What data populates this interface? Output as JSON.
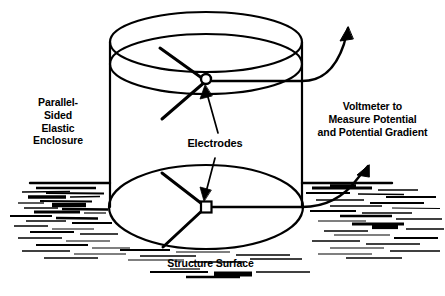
{
  "figure": {
    "kind": "technical-line-diagram",
    "background_color": "#ffffff",
    "ink_color": "#000000"
  },
  "labels": {
    "enclosure": "Parallel-\nSided\nElastic\nEnclosure",
    "voltmeter": "Voltmeter to\nMeasure Potential\nand Potential Gradient",
    "electrodes": "Electrodes",
    "structure_surface": "Structure Surface"
  },
  "parts": [
    {
      "name": "enclosure-cylinder",
      "label": "Parallel-Sided Elastic Enclosure"
    },
    {
      "name": "top-electrode",
      "label": "Electrode"
    },
    {
      "name": "bottom-electrode",
      "label": "Electrode"
    },
    {
      "name": "upper-lead-wire",
      "label": "Voltmeter lead"
    },
    {
      "name": "lower-lead-wire",
      "label": "Voltmeter lead"
    },
    {
      "name": "ground-surface",
      "label": "Structure Surface"
    }
  ],
  "geometry": {
    "cylinder": {
      "left_wall_x": 110,
      "right_wall_x": 302,
      "top_ellipse_cy": 42,
      "top_inner_ellipse_cy": 64,
      "bottom_ellipse_cy": 207,
      "rx": 96,
      "ry": 30,
      "bottom_ry": 42
    },
    "top_electrode": {
      "cx": 206,
      "cy": 81,
      "r": 5
    },
    "bottom_electrode": {
      "cx": 206,
      "cy": 207,
      "r": 5
    },
    "ground_line_y": 183,
    "spoke_count": 3
  }
}
